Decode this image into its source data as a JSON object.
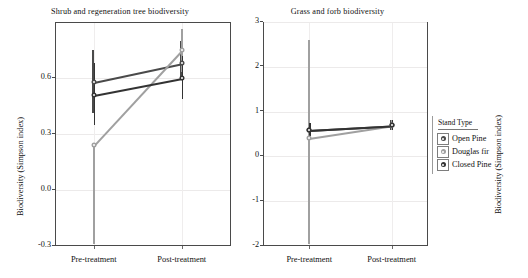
{
  "chart_data": [
    {
      "type": "line",
      "title": "Shrub and  regeneration  tree biodiversity",
      "xlabel": "",
      "ylabel": "Biodiversity (Simpson index)",
      "categories": [
        "Pre-treatment",
        "Post-treatment"
      ],
      "yticks": [
        "0.6",
        "0.3",
        "0.0",
        "-0.3"
      ],
      "ytick_values": [
        0.6,
        0.3,
        0.0,
        -0.3
      ],
      "ylim": [
        -0.3,
        0.9
      ],
      "grid": true,
      "legend_position": "right-outside",
      "series": [
        {
          "name": "Open Pine",
          "values": [
            0.58,
            0.68
          ],
          "err_low": [
            0.41,
            0.6
          ],
          "err_high": [
            0.75,
            0.8
          ]
        },
        {
          "name": "Douglas fir",
          "values": [
            0.24,
            0.75
          ],
          "err_low": [
            -0.29,
            0.63
          ],
          "err_high": [
            0.24,
            0.86
          ]
        },
        {
          "name": "Closed Pine",
          "values": [
            0.51,
            0.6
          ],
          "err_low": [
            0.35,
            0.49
          ],
          "err_high": [
            0.68,
            0.72
          ]
        }
      ]
    },
    {
      "type": "line",
      "title": "Grass  and  forb biodiversity",
      "xlabel": "",
      "ylabel": "Biodiversity (Simpson index)",
      "categories": [
        "Pre-treatment",
        "Post-treatment"
      ],
      "yticks": [
        "3",
        "2",
        "1",
        "0",
        "-1",
        "-2"
      ],
      "ytick_values": [
        3,
        2,
        1,
        0,
        -1,
        -2
      ],
      "ylim": [
        -2,
        3
      ],
      "grid": true,
      "legend_position": "right-outside",
      "series": [
        {
          "name": "Open Pine",
          "values": [
            0.6,
            0.7
          ],
          "err_low": [
            0.45,
            0.58
          ],
          "err_high": [
            0.75,
            0.82
          ]
        },
        {
          "name": "Douglas fir",
          "values": [
            0.42,
            0.7
          ],
          "err_low": [
            -1.95,
            0.58
          ],
          "err_high": [
            2.6,
            0.82
          ]
        },
        {
          "name": "Closed Pine",
          "values": [
            0.6,
            0.7
          ],
          "err_low": [
            0.45,
            0.58
          ],
          "err_high": [
            0.75,
            0.82
          ]
        }
      ]
    }
  ],
  "legend": {
    "title": "Stand Type",
    "items": [
      {
        "label": "Open Pine",
        "color": "#4a4a4a"
      },
      {
        "label": "Douglas fir",
        "color": "#a0a0a0"
      },
      {
        "label": "Closed Pine",
        "color": "#333333"
      }
    ]
  },
  "colors": {
    "open_pine": "#4a4a4a",
    "douglas_fir": "#a0a0a0",
    "closed_pine": "#333333",
    "axis": "#4a4a4a",
    "grid": "#ececec"
  }
}
